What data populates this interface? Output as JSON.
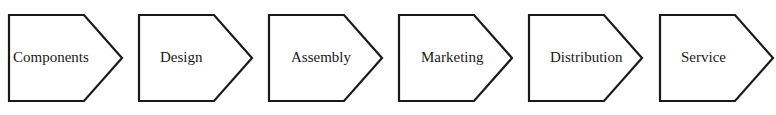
{
  "diagram": {
    "type": "chevron-process-flow",
    "stages": [
      {
        "label": "Components"
      },
      {
        "label": "Design"
      },
      {
        "label": "Assembly"
      },
      {
        "label": "Marketing"
      },
      {
        "label": "Distribution"
      },
      {
        "label": "Service"
      }
    ],
    "colors": {
      "stroke": "#1a1a1a",
      "fill": "#ffffff",
      "text": "#1a1a1a"
    }
  }
}
